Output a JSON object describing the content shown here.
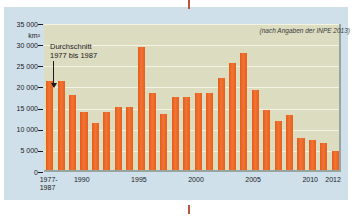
{
  "chart_data": {
    "type": "bar",
    "title": "",
    "subtitle": "",
    "source_note": "(nach Angaben der INPE 2013)",
    "xlabel": "",
    "ylabel": "km²",
    "ylim": [
      0,
      35000
    ],
    "grid": true,
    "legend": "none",
    "y_ticks": [
      "0",
      "5 000",
      "10 000",
      "15 000",
      "20 000",
      "25 000",
      "30 000",
      "35 000"
    ],
    "y_tick_values": [
      0,
      5000,
      10000,
      15000,
      20000,
      25000,
      30000,
      35000
    ],
    "x_tick_labels": [
      {
        "line1": "1977-",
        "line2": "1987",
        "index": 0
      },
      {
        "line1": "1990",
        "line2": "",
        "index": 3
      },
      {
        "line1": "1995",
        "line2": "",
        "index": 8
      },
      {
        "line1": "2000",
        "line2": "",
        "index": 13
      },
      {
        "line1": "2005",
        "line2": "",
        "index": 18
      },
      {
        "line1": "2010",
        "line2": "",
        "index": 23
      },
      {
        "line1": "2012",
        "line2": "",
        "index": 25
      }
    ],
    "categories": [
      "1977-1987",
      "1988",
      "1989",
      "1990",
      "1991",
      "1992",
      "1993",
      "1994",
      "1995",
      "1996",
      "1997",
      "1998",
      "1999",
      "2000",
      "2001",
      "2002",
      "2003",
      "2004",
      "2005",
      "2006",
      "2007",
      "2008",
      "2009",
      "2010",
      "2011",
      "2012"
    ],
    "values": [
      21050,
      21050,
      17770,
      13730,
      11030,
      13790,
      14900,
      14900,
      29060,
      18160,
      13230,
      17380,
      17260,
      18230,
      18170,
      21650,
      25400,
      27770,
      19010,
      14290,
      11650,
      12910,
      7460,
      7000,
      6420,
      4570
    ],
    "bar_color": "#ec6321",
    "plot_background": "#dcdcc0",
    "page_background": "#cfe0ea",
    "annotations": [
      {
        "name": "average-annotation",
        "line1": "Durchschnitt",
        "line2": "1977 bis 1987",
        "points_to_category": "1977-1987"
      }
    ]
  }
}
